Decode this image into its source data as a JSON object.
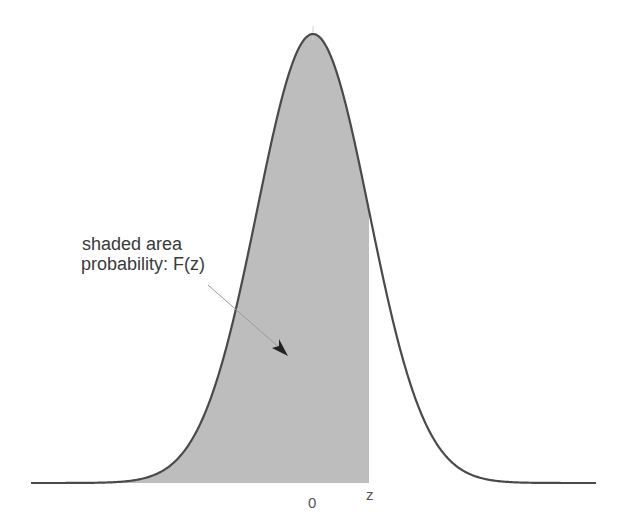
{
  "chart_data": {
    "type": "area",
    "title": "",
    "distribution": {
      "name": "normal",
      "mean": 0,
      "sd": 1
    },
    "shaded_region": {
      "from": "-inf",
      "to": "z"
    },
    "annotation": {
      "line1": "shaded area",
      "line2": "probability: F(z)"
    },
    "x_ticks": [
      {
        "label": "0",
        "value": 0
      },
      {
        "label": "z",
        "value": 1
      }
    ],
    "xlabel": "",
    "ylabel": "",
    "grid": false,
    "legend": "none"
  },
  "colors": {
    "curve": "#4a4a4a",
    "fill": "#bdbdbd",
    "text": "#3a3a3a",
    "arrow": "#222222"
  }
}
